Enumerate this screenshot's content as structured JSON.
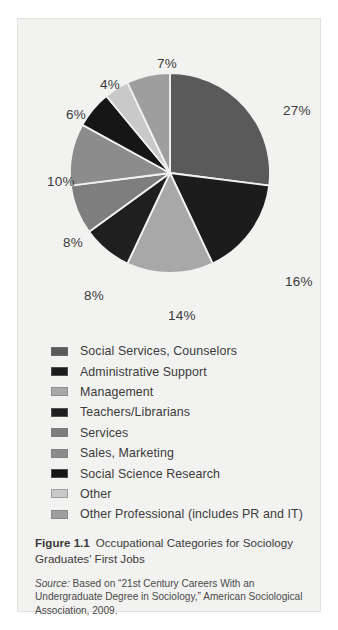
{
  "chart_data": {
    "type": "pie",
    "title": "Occupational Categories for Sociology Graduates' First Jobs",
    "start_angle_deg": 0,
    "direction": "clockwise",
    "categories": [
      "Social Services, Counselors",
      "Administrative Support",
      "Management",
      "Teachers/Librarians",
      "Services",
      "Sales, Marketing",
      "Social Science Research",
      "Other",
      "Other Professional (includes PR and IT)"
    ],
    "values": [
      27,
      16,
      14,
      8,
      8,
      10,
      6,
      4,
      7
    ],
    "value_labels": [
      "27%",
      "16%",
      "14%",
      "8%",
      "8%",
      "10%",
      "6%",
      "4%",
      "7%"
    ],
    "colors": [
      "#5a5a5a",
      "#1c1c1c",
      "#a8a8a8",
      "#1f1f1f",
      "#7e7e7e",
      "#8c8c8c",
      "#161616",
      "#c9c9c9",
      "#9e9e9e"
    ],
    "legend_position": "below",
    "grid": false,
    "units": "percent"
  },
  "chart": {
    "labels": [
      {
        "text": "27%",
        "left": 265,
        "top": 84
      },
      {
        "text": "16%",
        "left": 267,
        "top": 255
      },
      {
        "text": "14%",
        "left": 150,
        "top": 289
      },
      {
        "text": "8%",
        "left": 66,
        "top": 269
      },
      {
        "text": "8%",
        "left": 45,
        "top": 216
      },
      {
        "text": "10%",
        "left": 29,
        "top": 155
      },
      {
        "text": "6%",
        "left": 48,
        "top": 88
      },
      {
        "text": "4%",
        "left": 82,
        "top": 58
      },
      {
        "text": "7%",
        "left": 139,
        "top": 37
      }
    ]
  },
  "legend": {
    "items": [
      {
        "label": "Social Services, Counselors",
        "color": "#5a5a5a"
      },
      {
        "label": "Administrative Support",
        "color": "#1c1c1c"
      },
      {
        "label": "Management",
        "color": "#a8a8a8"
      },
      {
        "label": "Teachers/Librarians",
        "color": "#1f1f1f"
      },
      {
        "label": "Services",
        "color": "#7e7e7e"
      },
      {
        "label": "Sales, Marketing",
        "color": "#8c8c8c"
      },
      {
        "label": "Social Science Research",
        "color": "#161616"
      },
      {
        "label": "Other",
        "color": "#c9c9c9"
      },
      {
        "label": "Other Professional (includes PR and IT)",
        "color": "#9e9e9e"
      }
    ]
  },
  "caption": {
    "figure_number": "Figure 1.1",
    "title": "Occupational Categories for Sociology Graduates' First Jobs",
    "source_word": "Source:",
    "source_text": " Based on “21st Century Careers With an Undergraduate Degree in Sociology,” American Sociological Association, 2009."
  }
}
